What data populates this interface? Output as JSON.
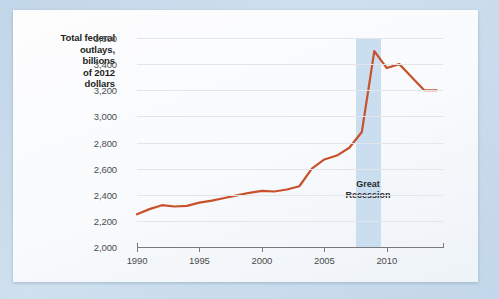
{
  "figure": {
    "background_color": "#c4d8ea",
    "panel_color": "#fbfcfd"
  },
  "chart_data": {
    "type": "line",
    "title": "",
    "xlabel": "",
    "ylabel": "Total federal outlays, billions of 2012 dollars",
    "ylabel_lines": [
      "Total federal",
      "outlays,",
      "billions",
      "of 2012",
      "dollars"
    ],
    "xlim": [
      1990,
      2014.5
    ],
    "ylim": [
      2000,
      3600
    ],
    "yticks": [
      2000,
      2200,
      2400,
      2600,
      2800,
      3000,
      3200,
      3400,
      3600
    ],
    "ytick_labels": [
      "2,000",
      "2,200",
      "2,400",
      "2,600",
      "2,800",
      "3,000",
      "3,200",
      "3,400",
      "3,600"
    ],
    "xticks": [
      1990,
      1995,
      2000,
      2005,
      2010
    ],
    "xtick_labels": [
      "1990",
      "1995",
      "2000",
      "2005",
      "2010"
    ],
    "grid": true,
    "legend": "none",
    "series": [
      {
        "name": "Total federal outlays",
        "color": "#c8502a",
        "x": [
          1990,
          1991,
          1992,
          1993,
          1994,
          1995,
          1996,
          1997,
          1998,
          1999,
          2000,
          2001,
          2002,
          2003,
          2004,
          2005,
          2006,
          2007,
          2008,
          2009,
          2010,
          2011,
          2012,
          2013,
          2014
        ],
        "y": [
          2250,
          2290,
          2320,
          2310,
          2315,
          2340,
          2355,
          2375,
          2395,
          2415,
          2430,
          2425,
          2440,
          2465,
          2600,
          2670,
          2700,
          2760,
          2880,
          3500,
          3370,
          3400,
          3300,
          3200,
          3200
        ]
      }
    ],
    "annotations": [
      {
        "name": "great-recession",
        "text": "Great Recession",
        "text_lines": [
          "Great",
          "Recession"
        ],
        "band_start": 2007.5,
        "band_end": 2009.5,
        "band_color": "#cadef0"
      }
    ]
  }
}
